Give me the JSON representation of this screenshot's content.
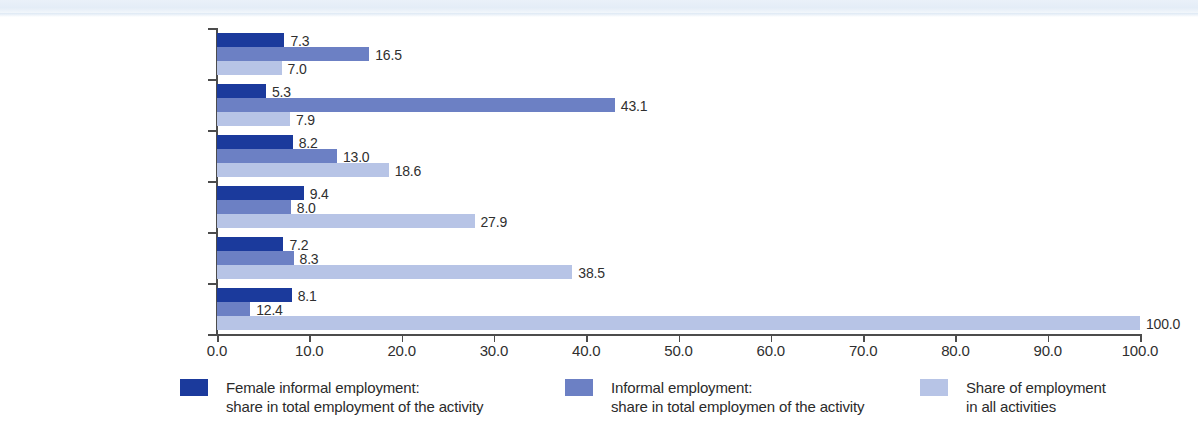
{
  "chart_data": {
    "type": "bar",
    "orientation": "horizontal",
    "title": "",
    "xlabel": "",
    "ylabel": "",
    "xlim": [
      0.0,
      100.0
    ],
    "xticks": [
      "0.0",
      "10.0",
      "20.0",
      "30.0",
      "40.0",
      "50.0",
      "60.0",
      "70.0",
      "80.0",
      "90.0",
      "100.0"
    ],
    "grid": false,
    "legend_position": "bottom",
    "categories": [
      "Transportation",
      "Construction",
      "Trade",
      "Manufacturing",
      "Services other than trade\nor transportation",
      "All non-agricultural\nactivities"
    ],
    "series": [
      {
        "name": "Female informal employment:\nshare in total employment of the activity",
        "color": "#1b3a9c",
        "values": [
          7.3,
          5.3,
          8.2,
          9.4,
          7.2,
          8.1
        ],
        "labels": [
          "7.3",
          "5.3",
          "8.2",
          "9.4",
          "7.2",
          "8.1"
        ]
      },
      {
        "name": "Informal employment:\nshare in total employmen of the activity",
        "color": "#6c80c4",
        "values": [
          16.5,
          43.1,
          13.0,
          8.0,
          8.3,
          12.4
        ],
        "labels": [
          "16.5",
          "43.1",
          "13.0",
          "8.0",
          "8.3",
          "12.4"
        ],
        "drawn_widths": [
          16.5,
          43.1,
          13.0,
          8.0,
          8.3,
          3.6
        ]
      },
      {
        "name": "Share of employment\nin all activities",
        "color": "#b7c4e6",
        "values": [
          7.0,
          7.9,
          18.6,
          27.9,
          38.5,
          100.0
        ],
        "labels": [
          "7.0",
          "7.9",
          "18.6",
          "27.9",
          "38.5",
          "100.0"
        ]
      }
    ]
  },
  "legend": {
    "items": [
      {
        "swatch": "s0",
        "text": "Female informal employment:\nshare in total employment of the activity",
        "left": 180
      },
      {
        "swatch": "s1",
        "text": "Informal employment:\nshare in total employmen of the activity",
        "left": 565
      },
      {
        "swatch": "s2",
        "text": "Share of employment\nin all activities",
        "left": 920
      }
    ]
  }
}
